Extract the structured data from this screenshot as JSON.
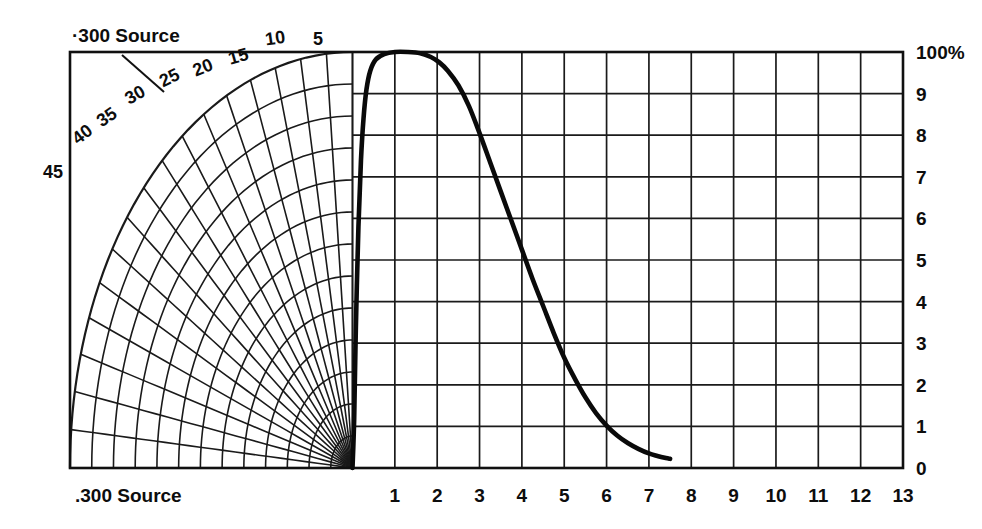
{
  "figure": {
    "background_color": "#ffffff",
    "ink_color": "#111111"
  },
  "labels": {
    "source_top": "·300 Source",
    "source_bottom": ".300 Source"
  },
  "chart_data": {
    "type": "line",
    "title": "",
    "subtitle": "",
    "xlabel": ".300 Source",
    "ylabel": "",
    "xlim": [
      0,
      13
    ],
    "ylim": [
      0,
      100
    ],
    "grid": true,
    "legend_position": "none",
    "x_tick_labels": [
      "1",
      "2",
      "3",
      "4",
      "5",
      "6",
      "7",
      "8",
      "9",
      "10",
      "11",
      "12",
      "13"
    ],
    "x_tick_values": [
      1,
      2,
      3,
      4,
      5,
      6,
      7,
      8,
      9,
      10,
      11,
      12,
      13
    ],
    "y_tick_labels": [
      "100%",
      "9",
      "8",
      "7",
      "6",
      "5",
      "4",
      "3",
      "2",
      "1",
      "0"
    ],
    "y_tick_values": [
      100,
      90,
      80,
      70,
      60,
      50,
      40,
      30,
      20,
      10,
      0
    ],
    "series": [
      {
        "name": "dose curve",
        "x": [
          0.0,
          0.04,
          0.08,
          0.14,
          0.2,
          0.26,
          0.33,
          0.42,
          0.55,
          0.75,
          1.0,
          1.3,
          1.6,
          1.85,
          2.05,
          2.25,
          2.5,
          2.75,
          3.0,
          3.25,
          3.5,
          3.75,
          4.0,
          4.25,
          4.5,
          4.75,
          5.0,
          5.25,
          5.5,
          5.75,
          6.0,
          6.25,
          6.5,
          6.75,
          7.0,
          7.2,
          7.4,
          7.5
        ],
        "y": [
          0.0,
          12.0,
          34.0,
          58.0,
          74.0,
          84.0,
          91.0,
          95.5,
          98.2,
          99.5,
          100.0,
          100.0,
          99.7,
          98.8,
          97.5,
          95.5,
          92.0,
          87.0,
          80.5,
          73.5,
          66.5,
          59.5,
          52.5,
          45.5,
          39.0,
          32.5,
          26.5,
          21.5,
          17.0,
          13.2,
          10.2,
          7.8,
          6.0,
          4.6,
          3.5,
          2.9,
          2.4,
          2.2
        ]
      }
    ],
    "annotations": [
      {
        "text": "·300 Source",
        "position": "top-left"
      },
      {
        "text": ".300 Source",
        "position": "bottom-left"
      }
    ],
    "polar_overlay": {
      "description": "radial isodose fan grid, quarter-polar, origin at x=0 on baseline",
      "angle_labels": [
        "5",
        "10",
        "15",
        "20",
        "25",
        "30",
        "35",
        "40",
        "45"
      ],
      "angle_values": [
        5,
        10,
        15,
        20,
        25,
        30,
        35,
        40,
        45
      ],
      "radial_ring_count": 13,
      "spoke_count": 17
    }
  }
}
